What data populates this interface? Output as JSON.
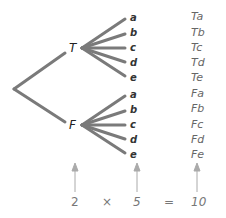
{
  "tree": {
    "first_stage": [
      {
        "label": "T",
        "branches": [
          "a",
          "b",
          "c",
          "d",
          "e"
        ]
      },
      {
        "label": "F",
        "branches": [
          "a",
          "b",
          "c",
          "d",
          "e"
        ]
      }
    ],
    "outcomes": [
      "Ta",
      "Tb",
      "Tc",
      "Td",
      "Te",
      "Fa",
      "Fb",
      "Fc",
      "Fd",
      "Fe"
    ]
  },
  "equation": {
    "first": "2",
    "times": "×",
    "second": "5",
    "equals": "=",
    "result": "10"
  },
  "colors": {
    "branch": "#7a7a7a",
    "arrow": "#aaaaaa"
  }
}
